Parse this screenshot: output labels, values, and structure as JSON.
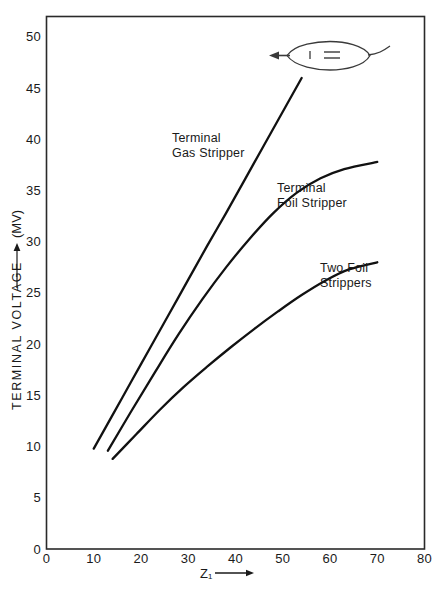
{
  "figure": {
    "background_color": "#ffffff",
    "line_color": "#111111",
    "axis_color": "#2a2a2a"
  },
  "chart_data": {
    "type": "line",
    "title": "",
    "xlabel": "Z₁",
    "ylabel": "TERMINAL VOLTAGE",
    "ylabel_units": "(MV)",
    "xlim": [
      0,
      80
    ],
    "ylim": [
      0,
      52
    ],
    "xticks": [
      0,
      10,
      20,
      30,
      40,
      50,
      60,
      70,
      80
    ],
    "xtick_labels": [
      "0",
      "10",
      "20",
      "30",
      "40",
      "50",
      "60",
      "70",
      "80"
    ],
    "yticks": [
      0,
      5,
      10,
      15,
      20,
      25,
      30,
      35,
      40,
      45,
      50
    ],
    "ytick_labels": [
      "0",
      "5",
      "10",
      "15",
      "20",
      "25",
      "30",
      "35",
      "40",
      "45",
      "50"
    ],
    "grid": false,
    "legend_position": "inline-annotations",
    "series": [
      {
        "name": "Terminal Gas Stripper",
        "label_line1": "Terminal",
        "label_line2": "Gas Stripper",
        "x": [
          10,
          14,
          18,
          22,
          26,
          30,
          34,
          38,
          42,
          46,
          50,
          54
        ],
        "y": [
          9.8,
          13.1,
          16.4,
          19.7,
          23.0,
          26.3,
          29.6,
          32.8,
          36.1,
          39.4,
          42.7,
          46.0
        ]
      },
      {
        "name": "Terminal Foil Stripper",
        "label_line1": "Terminal",
        "label_line2": "Foil Stripper",
        "x": [
          13,
          18,
          23,
          28,
          33,
          38,
          43,
          48,
          53,
          58,
          63,
          70
        ],
        "y": [
          9.6,
          13.5,
          17.3,
          21.0,
          24.4,
          27.5,
          30.3,
          32.8,
          34.8,
          36.2,
          37.1,
          37.8
        ]
      },
      {
        "name": "Two Foil Strippers",
        "label_line1": "Two Foil",
        "label_line2": "Strippers",
        "x": [
          14,
          19,
          24,
          29,
          34,
          39,
          44,
          49,
          54,
          59,
          64,
          70
        ],
        "y": [
          8.8,
          11.2,
          13.6,
          15.8,
          17.8,
          19.7,
          21.5,
          23.2,
          24.8,
          26.2,
          27.3,
          28.0
        ]
      }
    ],
    "annotations": [
      {
        "name": "lens-doodle",
        "description": "lens shaped outline with left arrow, vertical tick and equals glyph"
      }
    ]
  },
  "doodle": {
    "equals_glyph": "=",
    "tick_glyph": "|"
  }
}
